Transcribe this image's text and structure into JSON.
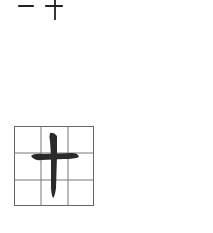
{
  "character": "十",
  "stroke_order": {
    "steps": [
      {
        "stroke": "horizontal",
        "label": "一"
      },
      {
        "stroke": "vertical",
        "label": "十"
      }
    ]
  },
  "practice_grid": {
    "rows": 3,
    "cols": 3,
    "line_color": "#555555",
    "ink_color": "#2a2a2a"
  }
}
